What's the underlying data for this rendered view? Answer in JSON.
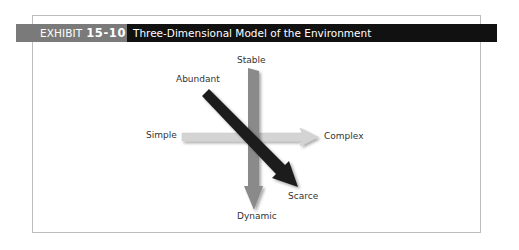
{
  "exhibit": {
    "label": "EXHIBIT",
    "number": "15-10",
    "title": "Three-Dimensional Model of the Environment"
  },
  "axes": {
    "stability": {
      "start_label": "Stable",
      "end_label": "Dynamic",
      "color": "#8a8a8a"
    },
    "complexity": {
      "start_label": "Simple",
      "end_label": "Complex",
      "color": "#d4d4d4"
    },
    "capacity": {
      "start_label": "Abundant",
      "end_label": "Scarce",
      "color": "#1e1e1e"
    }
  },
  "colors": {
    "header_label_bg": "#7a7a7a",
    "header_title_bg": "#111111",
    "frame_border": "#bdbdbd"
  }
}
